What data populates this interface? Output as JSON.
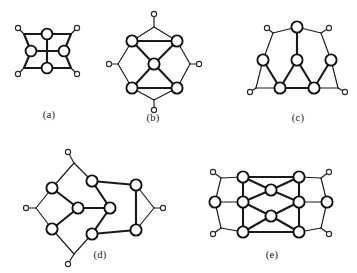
{
  "plate": {
    "title": "Five cubic graph diagrams with pendant vertices",
    "background_color": "#ffffff",
    "stroke_color": "#1a1a1a",
    "vertex_fill": "#ffffff",
    "width": 357,
    "height": 273
  },
  "figures": [
    {
      "id": "a",
      "label": "(a)",
      "label_pos": {
        "x": 49,
        "y": 118
      },
      "major_vertices": [
        {
          "name": "a-v-top",
          "x": 47,
          "y": 34,
          "r": 5.4
        },
        {
          "name": "a-v-left",
          "x": 31,
          "y": 51,
          "r": 5.4
        },
        {
          "name": "a-v-right",
          "x": 64,
          "y": 51,
          "r": 5.4
        },
        {
          "name": "a-v-bottom",
          "x": 47,
          "y": 68,
          "r": 5.4
        }
      ],
      "minor_vertices": [
        {
          "name": "a-p-tl",
          "x": 18,
          "y": 28,
          "r": 2.6
        },
        {
          "name": "a-p-tr",
          "x": 77,
          "y": 28,
          "r": 2.6
        },
        {
          "name": "a-p-bl",
          "x": 18,
          "y": 74,
          "r": 2.6
        },
        {
          "name": "a-p-br",
          "x": 77,
          "y": 74,
          "r": 2.6
        }
      ],
      "corners": [
        {
          "name": "a-c-tl",
          "x": 24,
          "y": 34
        },
        {
          "name": "a-c-tr",
          "x": 71,
          "y": 34
        },
        {
          "name": "a-c-bl",
          "x": 24,
          "y": 68
        },
        {
          "name": "a-c-br",
          "x": 71,
          "y": 68
        }
      ],
      "thick_edges": [
        {
          "from": "a-v-top",
          "to": "a-v-bottom"
        },
        {
          "from": "a-v-left",
          "to": "a-v-right"
        },
        {
          "from": "a-c-tl",
          "to": "a-v-top"
        },
        {
          "from": "a-v-top",
          "to": "a-c-tr"
        },
        {
          "from": "a-c-bl",
          "to": "a-v-bottom"
        },
        {
          "from": "a-v-bottom",
          "to": "a-c-br"
        },
        {
          "from": "a-c-tl",
          "to": "a-v-left"
        },
        {
          "from": "a-v-left",
          "to": "a-c-bl"
        },
        {
          "from": "a-c-tr",
          "to": "a-v-right"
        },
        {
          "from": "a-v-right",
          "to": "a-c-br"
        }
      ],
      "thin_edges": [
        {
          "from": "a-c-tl",
          "to": "a-p-tl"
        },
        {
          "from": "a-c-tr",
          "to": "a-p-tr"
        },
        {
          "from": "a-c-bl",
          "to": "a-p-bl"
        },
        {
          "from": "a-c-br",
          "to": "a-p-br"
        }
      ]
    },
    {
      "id": "b",
      "label": "(b)",
      "label_pos": {
        "x": 153,
        "y": 121
      },
      "major_vertices": [
        {
          "name": "b-v-ul",
          "x": 132,
          "y": 41,
          "r": 5.6
        },
        {
          "name": "b-v-ur",
          "x": 177,
          "y": 41,
          "r": 5.6
        },
        {
          "name": "b-v-ll",
          "x": 132,
          "y": 88,
          "r": 5.6
        },
        {
          "name": "b-v-lr",
          "x": 177,
          "y": 88,
          "r": 5.6
        },
        {
          "name": "b-v-center",
          "x": 154,
          "y": 64,
          "r": 5.6
        }
      ],
      "minor_vertices": [
        {
          "name": "b-p-top",
          "x": 154,
          "y": 14,
          "r": 2.6
        },
        {
          "name": "b-p-bottom",
          "x": 154,
          "y": 110,
          "r": 2.6
        },
        {
          "name": "b-p-left",
          "x": 109,
          "y": 64,
          "r": 2.6
        },
        {
          "name": "b-p-right",
          "x": 199,
          "y": 64,
          "r": 2.6
        }
      ],
      "corners": [
        {
          "name": "b-c-top",
          "x": 154,
          "y": 27
        },
        {
          "name": "b-c-bottom",
          "x": 154,
          "y": 100
        },
        {
          "name": "b-c-left",
          "x": 118,
          "y": 64
        },
        {
          "name": "b-c-right",
          "x": 190,
          "y": 64
        }
      ],
      "thick_edges": [
        {
          "from": "b-v-ul",
          "to": "b-v-ur"
        },
        {
          "from": "b-v-ul",
          "to": "b-v-center"
        },
        {
          "from": "b-v-ur",
          "to": "b-v-center"
        },
        {
          "from": "b-v-center",
          "to": "b-v-ll"
        },
        {
          "from": "b-v-center",
          "to": "b-v-lr"
        },
        {
          "from": "b-v-ll",
          "to": "b-v-lr"
        }
      ],
      "thin_edges": [
        {
          "from": "b-v-ul",
          "to": "b-c-top"
        },
        {
          "from": "b-c-top",
          "to": "b-v-ur"
        },
        {
          "from": "b-c-top",
          "to": "b-p-top"
        },
        {
          "from": "b-v-ll",
          "to": "b-c-bottom"
        },
        {
          "from": "b-c-bottom",
          "to": "b-v-lr"
        },
        {
          "from": "b-c-bottom",
          "to": "b-p-bottom"
        },
        {
          "from": "b-v-ul",
          "to": "b-c-left"
        },
        {
          "from": "b-c-left",
          "to": "b-v-ll"
        },
        {
          "from": "b-c-left",
          "to": "b-p-left"
        },
        {
          "from": "b-v-ur",
          "to": "b-c-right"
        },
        {
          "from": "b-c-right",
          "to": "b-v-lr"
        },
        {
          "from": "b-c-right",
          "to": "b-p-right"
        }
      ]
    },
    {
      "id": "c",
      "label": "(c)",
      "label_pos": {
        "x": 298,
        "y": 121
      },
      "major_vertices": [
        {
          "name": "c-v-apex",
          "x": 297,
          "y": 27,
          "r": 5.6
        },
        {
          "name": "c-v-l",
          "x": 263,
          "y": 60,
          "r": 5.6
        },
        {
          "name": "c-v-mid",
          "x": 297,
          "y": 60,
          "r": 5.6
        },
        {
          "name": "c-v-r",
          "x": 331,
          "y": 60,
          "r": 5.6
        },
        {
          "name": "c-v-bl",
          "x": 280,
          "y": 88,
          "r": 5.6
        },
        {
          "name": "c-v-br",
          "x": 314,
          "y": 88,
          "r": 5.6
        }
      ],
      "minor_vertices": [
        {
          "name": "c-p-tl",
          "x": 267,
          "y": 28,
          "r": 2.6
        },
        {
          "name": "c-p-tr",
          "x": 329,
          "y": 28,
          "r": 2.6
        },
        {
          "name": "c-p-bl",
          "x": 250,
          "y": 92,
          "r": 2.6
        },
        {
          "name": "c-p-br",
          "x": 345,
          "y": 92,
          "r": 2.6
        }
      ],
      "corners": [
        {
          "name": "c-c-tl",
          "x": 273,
          "y": 33
        },
        {
          "name": "c-c-tr",
          "x": 321,
          "y": 33
        },
        {
          "name": "c-c-fl",
          "x": 256,
          "y": 88
        },
        {
          "name": "c-c-fr",
          "x": 338,
          "y": 88
        }
      ],
      "thick_edges": [
        {
          "from": "c-v-apex",
          "to": "c-v-mid"
        },
        {
          "from": "c-v-mid",
          "to": "c-v-bl"
        },
        {
          "from": "c-v-mid",
          "to": "c-v-br"
        },
        {
          "from": "c-v-bl",
          "to": "c-v-br"
        },
        {
          "from": "c-v-l",
          "to": "c-v-bl"
        },
        {
          "from": "c-v-r",
          "to": "c-v-br"
        }
      ],
      "thin_edges": [
        {
          "from": "c-v-apex",
          "to": "c-c-tl"
        },
        {
          "from": "c-v-apex",
          "to": "c-c-tr"
        },
        {
          "from": "c-c-tl",
          "to": "c-p-tl"
        },
        {
          "from": "c-c-tr",
          "to": "c-p-tr"
        },
        {
          "from": "c-c-tl",
          "to": "c-v-l"
        },
        {
          "from": "c-c-tr",
          "to": "c-v-r"
        },
        {
          "from": "c-v-l",
          "to": "c-c-fl"
        },
        {
          "from": "c-v-r",
          "to": "c-c-fr"
        },
        {
          "from": "c-c-fl",
          "to": "c-v-bl"
        },
        {
          "from": "c-c-fr",
          "to": "c-v-br"
        },
        {
          "from": "c-c-fl",
          "to": "c-p-bl"
        },
        {
          "from": "c-c-fr",
          "to": "c-p-br"
        }
      ]
    },
    {
      "id": "d",
      "label": "(d)",
      "label_pos": {
        "x": 100,
        "y": 258
      },
      "major_vertices": [
        {
          "name": "d-v-tm",
          "x": 92,
          "y": 181,
          "r": 5.6
        },
        {
          "name": "d-v-tl",
          "x": 52,
          "y": 188,
          "r": 5.6
        },
        {
          "name": "d-v-tr",
          "x": 136,
          "y": 185,
          "r": 5.6
        },
        {
          "name": "d-v-cl",
          "x": 78,
          "y": 208,
          "r": 5.6
        },
        {
          "name": "d-v-cm",
          "x": 110,
          "y": 208,
          "r": 5.6
        },
        {
          "name": "d-v-bl",
          "x": 52,
          "y": 229,
          "r": 5.6
        },
        {
          "name": "d-v-bm",
          "x": 92,
          "y": 234,
          "r": 5.6
        },
        {
          "name": "d-v-br",
          "x": 136,
          "y": 230,
          "r": 5.6
        }
      ],
      "minor_vertices": [
        {
          "name": "d-p-top",
          "x": 68,
          "y": 152,
          "r": 2.6
        },
        {
          "name": "d-p-left",
          "x": 26,
          "y": 208,
          "r": 2.6
        },
        {
          "name": "d-p-bot",
          "x": 68,
          "y": 264,
          "r": 2.6
        },
        {
          "name": "d-p-right",
          "x": 163,
          "y": 208,
          "r": 2.6
        }
      ],
      "corners": [
        {
          "name": "d-c-top",
          "x": 74,
          "y": 163
        },
        {
          "name": "d-c-left",
          "x": 36,
          "y": 208
        },
        {
          "name": "d-c-bot",
          "x": 74,
          "y": 254
        },
        {
          "name": "d-c-right",
          "x": 154,
          "y": 208
        }
      ],
      "thick_edges": [
        {
          "from": "d-v-tl",
          "to": "d-v-cl"
        },
        {
          "from": "d-v-cl",
          "to": "d-v-bl"
        },
        {
          "from": "d-v-cl",
          "to": "d-v-cm"
        },
        {
          "from": "d-v-cm",
          "to": "d-v-tm"
        },
        {
          "from": "d-v-cm",
          "to": "d-v-bm"
        },
        {
          "from": "d-v-tm",
          "to": "d-v-tr"
        },
        {
          "from": "d-v-bm",
          "to": "d-v-br"
        },
        {
          "from": "d-v-tr",
          "to": "d-v-br"
        }
      ],
      "thin_edges": [
        {
          "from": "d-v-tl",
          "to": "d-c-top"
        },
        {
          "from": "d-c-top",
          "to": "d-v-tm"
        },
        {
          "from": "d-c-top",
          "to": "d-p-top"
        },
        {
          "from": "d-v-tl",
          "to": "d-c-left"
        },
        {
          "from": "d-c-left",
          "to": "d-v-bl"
        },
        {
          "from": "d-c-left",
          "to": "d-p-left"
        },
        {
          "from": "d-v-bl",
          "to": "d-c-bot"
        },
        {
          "from": "d-c-bot",
          "to": "d-v-bm"
        },
        {
          "from": "d-c-bot",
          "to": "d-p-bot"
        },
        {
          "from": "d-v-tr",
          "to": "d-c-right"
        },
        {
          "from": "d-c-right",
          "to": "d-v-br"
        },
        {
          "from": "d-c-right",
          "to": "d-p-right"
        },
        {
          "from": "d-v-tm",
          "to": "d-v-cm"
        },
        {
          "from": "d-v-bm",
          "to": "d-v-cm"
        }
      ]
    },
    {
      "id": "e",
      "label": "(e)",
      "label_pos": {
        "x": 272,
        "y": 258
      },
      "major_vertices": [
        {
          "name": "e-v-tl",
          "x": 243,
          "y": 177,
          "r": 5.6
        },
        {
          "name": "e-v-tr",
          "x": 299,
          "y": 177,
          "r": 5.6
        },
        {
          "name": "e-v-ml",
          "x": 243,
          "y": 202,
          "r": 5.6
        },
        {
          "name": "e-v-mr",
          "x": 299,
          "y": 202,
          "r": 5.6
        },
        {
          "name": "e-v-bl",
          "x": 243,
          "y": 232,
          "r": 5.6
        },
        {
          "name": "e-v-br",
          "x": 299,
          "y": 232,
          "r": 5.6
        },
        {
          "name": "e-v-ct",
          "x": 271,
          "y": 190,
          "r": 5.6
        },
        {
          "name": "e-v-cb",
          "x": 271,
          "y": 216,
          "r": 5.6
        },
        {
          "name": "e-v-fl",
          "x": 215,
          "y": 202,
          "r": 5.6
        },
        {
          "name": "e-v-fr",
          "x": 327,
          "y": 202,
          "r": 5.6
        }
      ],
      "minor_vertices": [
        {
          "name": "e-p-tl",
          "x": 213,
          "y": 172,
          "r": 2.6
        },
        {
          "name": "e-p-tr",
          "x": 329,
          "y": 172,
          "r": 2.6
        },
        {
          "name": "e-p-bl",
          "x": 213,
          "y": 234,
          "r": 2.6
        },
        {
          "name": "e-p-br",
          "x": 329,
          "y": 234,
          "r": 2.6
        }
      ],
      "corners": [
        {
          "name": "e-c-tl",
          "x": 221,
          "y": 178
        },
        {
          "name": "e-c-tr",
          "x": 321,
          "y": 178
        },
        {
          "name": "e-c-bl",
          "x": 221,
          "y": 228
        },
        {
          "name": "e-c-br",
          "x": 321,
          "y": 228
        }
      ],
      "thick_edges": [
        {
          "from": "e-v-tl",
          "to": "e-v-ml"
        },
        {
          "from": "e-v-ml",
          "to": "e-v-bl"
        },
        {
          "from": "e-v-tr",
          "to": "e-v-mr"
        },
        {
          "from": "e-v-mr",
          "to": "e-v-br"
        },
        {
          "from": "e-v-tl",
          "to": "e-v-ct"
        },
        {
          "from": "e-v-tr",
          "to": "e-v-ct"
        },
        {
          "from": "e-v-ct",
          "to": "e-v-ml"
        },
        {
          "from": "e-v-ct",
          "to": "e-v-mr"
        },
        {
          "from": "e-v-ml",
          "to": "e-v-cb"
        },
        {
          "from": "e-v-mr",
          "to": "e-v-cb"
        },
        {
          "from": "e-v-cb",
          "to": "e-v-bl"
        },
        {
          "from": "e-v-cb",
          "to": "e-v-br"
        },
        {
          "from": "e-v-tl",
          "to": "e-v-tr"
        },
        {
          "from": "e-v-bl",
          "to": "e-v-br"
        }
      ],
      "thin_edges": [
        {
          "from": "e-v-tl",
          "to": "e-c-tl"
        },
        {
          "from": "e-c-tl",
          "to": "e-v-fl"
        },
        {
          "from": "e-c-tl",
          "to": "e-p-tl"
        },
        {
          "from": "e-v-fl",
          "to": "e-c-bl"
        },
        {
          "from": "e-c-bl",
          "to": "e-v-bl"
        },
        {
          "from": "e-c-bl",
          "to": "e-p-bl"
        },
        {
          "from": "e-v-tr",
          "to": "e-c-tr"
        },
        {
          "from": "e-c-tr",
          "to": "e-v-fr"
        },
        {
          "from": "e-c-tr",
          "to": "e-p-tr"
        },
        {
          "from": "e-v-fr",
          "to": "e-c-br"
        },
        {
          "from": "e-c-br",
          "to": "e-v-br"
        },
        {
          "from": "e-c-br",
          "to": "e-p-br"
        },
        {
          "from": "e-v-fl",
          "to": "e-v-ml"
        },
        {
          "from": "e-v-fr",
          "to": "e-v-mr"
        }
      ]
    }
  ]
}
